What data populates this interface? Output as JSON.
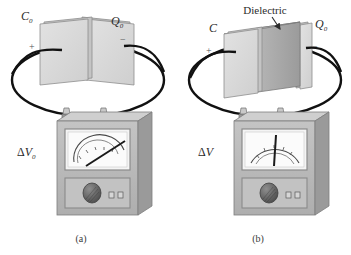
{
  "figure": {
    "background_color": "#ffffff",
    "ink_color": "#2b2b2b",
    "plate_face_color": "#d9d9d9",
    "plate_edge_color": "#b0b0b0",
    "dielectric_color": "#a8a8a8",
    "meter_body_color": "#b9b9b9",
    "meter_top_color": "#cfcfcf",
    "meter_side_color": "#9a9a9a",
    "dial_face_color": "#f2f2f2"
  },
  "panel_a": {
    "caption": "(a)",
    "capacitance_label": "C",
    "capacitance_sub": "0",
    "charge_label": "Q",
    "charge_sub": "0",
    "plus_sign": "+",
    "minus_sign": "−",
    "voltage_label": "ΔV",
    "voltage_sub": "0",
    "needle_angle_deg": 48,
    "has_dielectric": false
  },
  "panel_b": {
    "caption": "(b)",
    "capacitance_label": "C",
    "capacitance_sub": "",
    "charge_label": "Q",
    "charge_sub": "0",
    "plus_sign": "+",
    "minus_sign": "−",
    "voltage_label": "ΔV",
    "voltage_sub": "",
    "dielectric_label": "Dielectric",
    "needle_angle_deg": 2,
    "has_dielectric": true
  }
}
